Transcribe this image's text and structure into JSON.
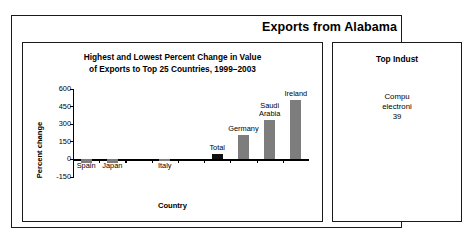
{
  "header": {
    "title": "Exports from Alabama"
  },
  "chart_panel": {
    "title_line1": "Highest and Lowest Percent Change in Value",
    "title_line2": "of Exports to Top 25 Countries, 1999–2003"
  },
  "industry_panel": {
    "title": "Top Indust",
    "body_line1": "Compu",
    "body_line2": "electroni",
    "body_line3": "39"
  },
  "chart_data": {
    "type": "bar",
    "title": "Highest and Lowest Percent Change in Value of Exports to Top 25 Countries, 1999–2003",
    "xlabel": "Country",
    "ylabel": "Percent change",
    "ylim": [
      -150,
      600
    ],
    "yticks": [
      600,
      450,
      300,
      150,
      0,
      -150
    ],
    "ytick_labels": [
      "600",
      "450",
      "300",
      "150",
      "0",
      "-150"
    ],
    "grid": false,
    "legend": "none",
    "categories": [
      "Spain",
      "Japan",
      "",
      "Italy",
      "",
      "Total",
      "Germany",
      "Saudi Arabia",
      "Ireland"
    ],
    "values": [
      -30,
      -30,
      0,
      -12,
      0,
      50,
      210,
      340,
      510
    ],
    "bar_colors": [
      "#7d7d7d",
      "#7d7d7d",
      "#7d7d7d",
      "#7d7d7d",
      "#7d7d7d",
      "#111111",
      "#7d7d7d",
      "#7d7d7d",
      "#7d7d7d"
    ],
    "bars": [
      {
        "label": "Spain",
        "value": -30,
        "label_pos": "below",
        "color": "#7d7d7d"
      },
      {
        "label": "Japan",
        "value": -30,
        "label_pos": "below",
        "color": "#7d7d7d"
      },
      {
        "label": "Italy",
        "value": -12,
        "label_pos": "below",
        "color": "#7d7d7d"
      },
      {
        "label": "Total",
        "value": 50,
        "label_pos": "above",
        "color": "#111111"
      },
      {
        "label": "Germany",
        "value": 210,
        "label_pos": "above",
        "color": "#7d7d7d"
      },
      {
        "label": "Saudi Arabia",
        "value": 340,
        "label_pos": "above",
        "color": "#7d7d7d"
      },
      {
        "label": "Ireland",
        "value": 510,
        "label_pos": "above",
        "color": "#7d7d7d"
      }
    ]
  },
  "colors": {
    "bar_gray": "#7d7d7d",
    "bar_black": "#111111",
    "border": "#1a1a1a",
    "text": "#000000",
    "background": "#ffffff"
  }
}
